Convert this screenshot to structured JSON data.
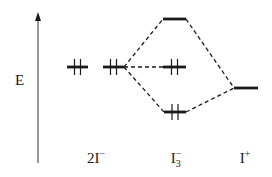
{
  "diagram": {
    "type": "molecular-orbital-energy-diagram",
    "axis": {
      "label": "E",
      "direction": "up",
      "x": 38,
      "y_top": 12,
      "y_bottom": 163
    },
    "species": [
      {
        "id": "2I-",
        "base": "2I",
        "sub": "",
        "sup": "−",
        "label_text": "2I⁻"
      },
      {
        "id": "I3-",
        "base": "I",
        "sub": "3",
        "sup": "−",
        "label_text": "I₃⁻"
      },
      {
        "id": "I+",
        "base": "I",
        "sub": "",
        "sup": "+",
        "label_text": "I⁺"
      }
    ],
    "levels": [
      {
        "id": "2I-_a",
        "species": "2I-",
        "x1": 67,
        "x2": 88,
        "y": 67,
        "electrons": 2
      },
      {
        "id": "2I-_b",
        "species": "2I-",
        "x1": 103,
        "x2": 124,
        "y": 67,
        "electrons": 2
      },
      {
        "id": "I3-_antibonding",
        "species": "I3-",
        "x1": 163,
        "x2": 186,
        "y": 19,
        "electrons": 0
      },
      {
        "id": "I3-_nonbonding",
        "species": "I3-",
        "x1": 163,
        "x2": 186,
        "y": 67,
        "electrons": 2
      },
      {
        "id": "I3-_bonding",
        "species": "I3-",
        "x1": 164,
        "x2": 186,
        "y": 112,
        "electrons": 2
      },
      {
        "id": "I+_level",
        "species": "I+",
        "x1": 234,
        "x2": 258,
        "y": 88,
        "electrons": 0
      }
    ],
    "connectors": [
      {
        "from": "2I-_b",
        "to": "I3-_antibonding",
        "x1": 124,
        "y1": 67,
        "x2": 163,
        "y2": 19
      },
      {
        "from": "2I-_b",
        "to": "I3-_nonbonding",
        "x1": 124,
        "y1": 67,
        "x2": 163,
        "y2": 67
      },
      {
        "from": "2I-_b",
        "to": "I3-_bonding",
        "x1": 124,
        "y1": 67,
        "x2": 164,
        "y2": 112
      },
      {
        "from": "I3-_antibonding",
        "to": "I+_level",
        "x1": 186,
        "y1": 19,
        "x2": 234,
        "y2": 88
      },
      {
        "from": "I3-_bonding",
        "to": "I+_level",
        "x1": 186,
        "y1": 112,
        "x2": 234,
        "y2": 88
      }
    ],
    "colors": {
      "ink": "#1a1a1a",
      "axis": "#555555",
      "background": "#ffffff"
    }
  }
}
